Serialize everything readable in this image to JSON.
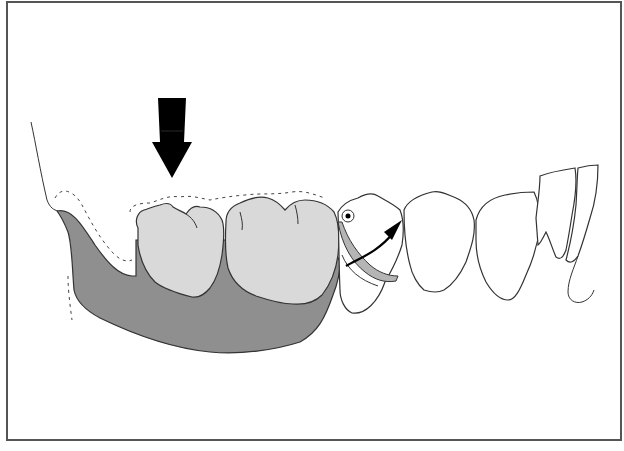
{
  "figure": {
    "colors": {
      "frame_border": "#555555",
      "denture_base": "#8f8f8f",
      "denture_teeth": "#d9d9d9",
      "natural_teeth": "#ffffff",
      "outline": "#333333",
      "arrow": "#000000",
      "clasp": "#b5b5b5"
    },
    "elements": [
      {
        "id": "occlusal-force-arrow",
        "label": "Occlusal load arrow (downward)"
      },
      {
        "id": "denture-base",
        "label": "Distal extension denture base"
      },
      {
        "id": "artificial-molar-1",
        "label": "Artificial molar"
      },
      {
        "id": "artificial-molar-2",
        "label": "Artificial molar"
      },
      {
        "id": "abutment-premolar",
        "label": "Abutment tooth with rest"
      },
      {
        "id": "clasp-arm",
        "label": "Clasp arm"
      },
      {
        "id": "rotation-arrow",
        "label": "Rotational movement arrow"
      },
      {
        "id": "premolar",
        "label": "Natural premolar"
      },
      {
        "id": "canine",
        "label": "Natural canine"
      },
      {
        "id": "incisors",
        "label": "Natural incisors"
      },
      {
        "id": "ridge-outline",
        "label": "Residual ridge outline (dashed)"
      }
    ]
  }
}
